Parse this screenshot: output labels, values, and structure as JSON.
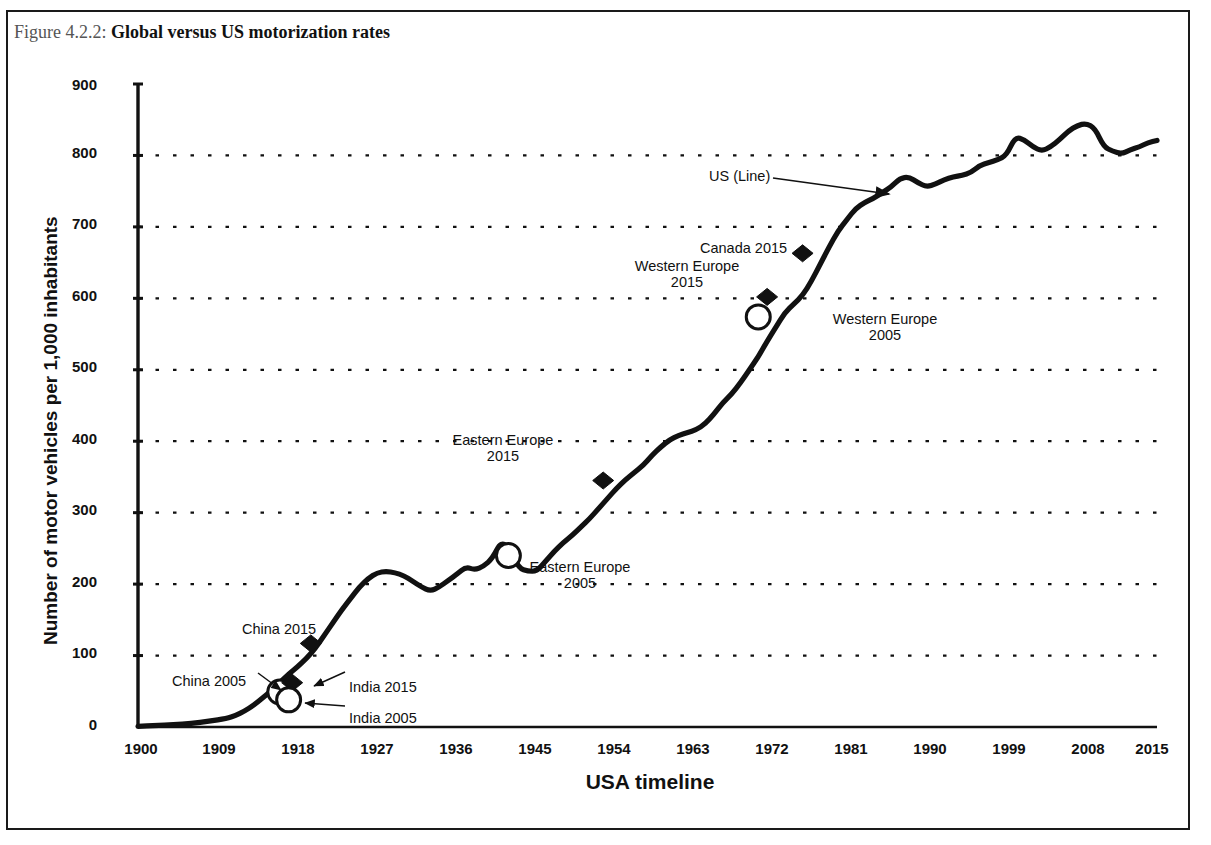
{
  "figure": {
    "caption_number": "Figure 4.2.2:",
    "caption_title": "Global versus US motorization rates"
  },
  "chart_data": {
    "type": "line",
    "title": "Global versus US motorization rates",
    "xlabel": "USA timeline",
    "ylabel": "Number of motor vehicles per 1,000 inhabitants",
    "xlim": [
      1900,
      2015
    ],
    "ylim": [
      0,
      900
    ],
    "grid": "horizontal-dotted",
    "legend": "none",
    "y_ticks": [
      "0",
      "100",
      "200",
      "300",
      "400",
      "500",
      "600",
      "700",
      "800",
      "900"
    ],
    "y_tick_values": [
      0,
      100,
      200,
      300,
      400,
      500,
      600,
      700,
      800,
      900
    ],
    "x_ticks": [
      "1900",
      "1909",
      "1918",
      "1927",
      "1936",
      "1945",
      "1954",
      "1963",
      "1972",
      "1981",
      "1990",
      "1999",
      "2008",
      "2015"
    ],
    "x_tick_values": [
      1900,
      1909,
      1918,
      1927,
      1936,
      1945,
      1954,
      1963,
      1972,
      1981,
      1990,
      1999,
      2008,
      2015
    ],
    "series": [
      {
        "name": "US (Line)",
        "style": "solid-black-thick",
        "x": [
          1900,
          1902,
          1904,
          1906,
          1908,
          1910,
          1911,
          1912,
          1913,
          1914,
          1915,
          1916,
          1917,
          1918,
          1919,
          1920,
          1921,
          1922,
          1923,
          1924,
          1925,
          1926,
          1927,
          1928,
          1929,
          1930,
          1931,
          1932,
          1933,
          1934,
          1935,
          1936,
          1937,
          1938,
          1939,
          1940,
          1941,
          1942,
          1943,
          1944,
          1945,
          1946,
          1947,
          1948,
          1949,
          1950,
          1951,
          1952,
          1953,
          1954,
          1955,
          1956,
          1957,
          1958,
          1959,
          1960,
          1961,
          1962,
          1963,
          1964,
          1965,
          1966,
          1967,
          1968,
          1969,
          1970,
          1971,
          1972,
          1973,
          1974,
          1975,
          1976,
          1977,
          1978,
          1979,
          1980,
          1981,
          1982,
          1983,
          1984,
          1985,
          1986,
          1987,
          1988,
          1989,
          1990,
          1991,
          1992,
          1993,
          1994,
          1995,
          1996,
          1997,
          1998,
          1999,
          2000,
          2001,
          2002,
          2003,
          2004,
          2005,
          2006,
          2007,
          2008,
          2009,
          2010,
          2011,
          2012,
          2013,
          2014,
          2015
        ],
        "y": [
          1,
          2,
          3,
          5,
          8,
          12,
          16,
          22,
          30,
          40,
          50,
          62,
          74,
          84,
          96,
          110,
          128,
          146,
          164,
          180,
          196,
          208,
          216,
          218,
          216,
          212,
          204,
          196,
          190,
          196,
          205,
          214,
          224,
          220,
          225,
          236,
          260,
          248,
          222,
          218,
          218,
          232,
          246,
          258,
          268,
          280,
          292,
          306,
          320,
          334,
          346,
          356,
          366,
          380,
          392,
          402,
          408,
          412,
          416,
          424,
          438,
          454,
          466,
          482,
          500,
          518,
          540,
          560,
          580,
          592,
          604,
          624,
          648,
          672,
          694,
          710,
          726,
          734,
          740,
          748,
          756,
          768,
          770,
          762,
          756,
          760,
          766,
          770,
          772,
          776,
          786,
          790,
          794,
          800,
          826,
          822,
          812,
          806,
          812,
          822,
          834,
          842,
          845,
          838,
          812,
          806,
          802,
          808,
          812,
          818,
          821
        ]
      }
    ],
    "markers": [
      {
        "label": "China 2015",
        "shape": "filled-diamond",
        "x_pixel_year": 1919.5,
        "value": 117,
        "note": "China motorization rate in 2015 equals US level of ~1919"
      },
      {
        "label": "China 2005",
        "shape": "open-circle",
        "x_pixel_year": 1916,
        "value": 49,
        "note": "China motorization rate in 2005 equals US level of ~1916"
      },
      {
        "label": "India 2015",
        "shape": "filled-diamond",
        "x_pixel_year": 1917.4,
        "value": 62,
        "note": "India motorization rate in 2015 equals US level of ~1917"
      },
      {
        "label": "India 2005",
        "shape": "open-circle",
        "x_pixel_year": 1917,
        "value": 38,
        "note": "India motorization rate in 2005"
      },
      {
        "label": "Eastern Europe 2015",
        "shape": "filled-diamond",
        "x_pixel_year": 1952.5,
        "value": 345
      },
      {
        "label": "Eastern Europe 2005",
        "shape": "open-circle",
        "x_pixel_year": 1941.8,
        "value": 240
      },
      {
        "label": "Western Europe 2015",
        "shape": "filled-diamond",
        "x_pixel_year": 1971,
        "value": 602
      },
      {
        "label": "Western Europe 2005",
        "shape": "open-circle",
        "x_pixel_year": 1970,
        "value": 574
      },
      {
        "label": "Canada 2015",
        "shape": "filled-diamond",
        "x_pixel_year": 1975,
        "value": 663
      }
    ],
    "annotations": [
      {
        "text": "US (Line)",
        "has_arrow": true,
        "points_to": "us-line"
      },
      {
        "text": "China 2015",
        "has_arrow": false
      },
      {
        "text": "China 2005",
        "has_arrow": true
      },
      {
        "text": "India 2015",
        "has_arrow": true
      },
      {
        "text": "India 2005",
        "has_arrow": true
      },
      {
        "text": "Eastern Europe\n2015",
        "has_arrow": false
      },
      {
        "text": "Eastern Europe\n2005",
        "has_arrow": false
      },
      {
        "text": "Western Europe\n2015",
        "has_arrow": false
      },
      {
        "text": "Western Europe\n2005",
        "has_arrow": false
      },
      {
        "text": "Canada 2015",
        "has_arrow": false
      }
    ],
    "colors": {
      "line": "#111111",
      "grid": "#111111",
      "axis": "#111111",
      "text": "#111111",
      "background": "#ffffff",
      "marker_fill": "#111111",
      "marker_open_fill": "#ffffff"
    }
  },
  "annotation_labels": {
    "us_line": "US (Line)",
    "china_2015": "China 2015",
    "china_2005": "China 2005",
    "india_2015": "India 2015",
    "india_2005": "India 2005",
    "eastern_europe_2015_l1": "Eastern Europe",
    "eastern_europe_2015_l2": "2015",
    "eastern_europe_2005_l1": "Eastern Europe",
    "eastern_europe_2005_l2": "2005",
    "western_europe_2015_l1": "Western Europe",
    "western_europe_2015_l2": "2015",
    "western_europe_2005_l1": "Western Europe",
    "western_europe_2005_l2": "2005",
    "canada_2015": "Canada 2015"
  }
}
